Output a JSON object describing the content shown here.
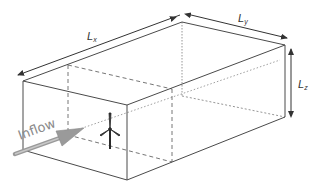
{
  "diagram": {
    "type": "3d-box-domain",
    "labels": {
      "lx_main": "L",
      "lx_sub": "x",
      "ly_main": "L",
      "ly_sub": "y",
      "lz_main": "L",
      "lz_sub": "z",
      "inflow": "Inflow"
    },
    "colors": {
      "edge": "#4a4a4a",
      "hidden_edge": "#7a7a7a",
      "arrow": "#333333",
      "inflow_arrow": "#9a9a9a",
      "inflow_text": "#8a8a8a",
      "turbine": "#2a2a2a",
      "background": "#ffffff"
    },
    "elements": [
      "box-visible-edges",
      "box-hidden-edges",
      "inner-cross-section-plane",
      "lx-dimension-arrow",
      "ly-dimension-arrow",
      "lz-dimension-arrow",
      "inflow-arrow",
      "wind-turbine-icon",
      "centerline"
    ]
  }
}
